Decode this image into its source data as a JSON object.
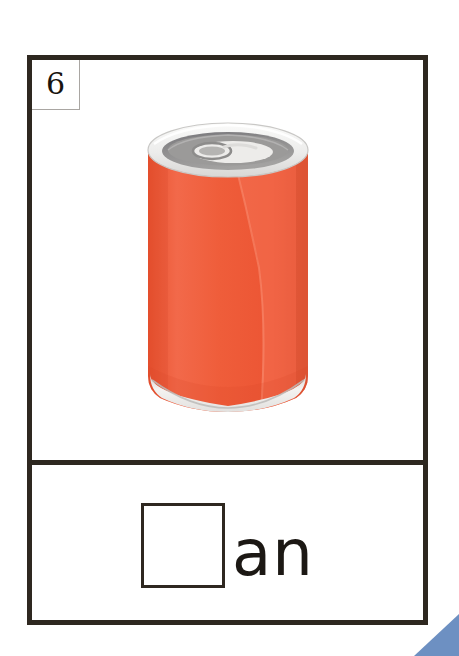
{
  "worksheet": {
    "item_number": "6",
    "word_ending": "an",
    "answer_word": "can",
    "blank_box_label": "missing letter blank",
    "colors": {
      "card_border": "#2e2820",
      "badge_border": "#a9a6a2",
      "text": "#1c1814",
      "corner_triangle": "#6d90c2",
      "can_body": "#ee5a3c",
      "can_body_shadow": "#e04c30",
      "can_body_highlight": "#f5765a",
      "can_lid_rim": "#f2f1ef",
      "can_lid_inner": "#8e8d8b",
      "can_tab": "#cfcecc",
      "can_bottom_rim": "#e9e8e6",
      "background": "#ffffff"
    }
  },
  "illustration": {
    "name": "soda-can",
    "alt": "Orange aluminum soda can with pull tab",
    "parts": [
      "can-lid",
      "can-pull-tab",
      "can-body",
      "can-body-highlight",
      "can-bottom-rim"
    ]
  }
}
